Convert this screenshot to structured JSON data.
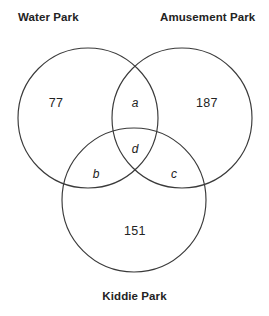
{
  "diagram": {
    "type": "venn-diagram-3-set",
    "stroke_color": "#3a3a3a",
    "background_color": "#ffffff",
    "sets": [
      {
        "id": "water",
        "label": "Water Park"
      },
      {
        "id": "amusement",
        "label": "Amusement Park"
      },
      {
        "id": "kiddie",
        "label": "Kiddie Park"
      }
    ],
    "regions": {
      "water_only": "77",
      "amusement_only": "187",
      "kiddie_only": "151",
      "water_amusement": "a",
      "water_kiddie": "b",
      "amusement_kiddie": "c",
      "all_three": "d"
    }
  }
}
